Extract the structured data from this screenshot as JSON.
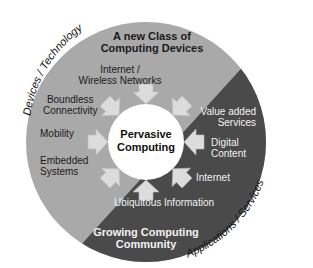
{
  "diagram": {
    "center": {
      "label_line1": "Pervasive",
      "label_line2": "Computing"
    },
    "outer_labels": {
      "top_left": "Devices / Technology",
      "bottom_right": "Applications / Services"
    },
    "segments": {
      "devices": {
        "title_line1": "A new Class of",
        "title_line2": "Computing Devices",
        "color": "#a9a9a9",
        "items": [
          {
            "line1": "Internet /",
            "line2": "Wireless Networks"
          },
          {
            "line1": "Boundless",
            "line2": "Connectivity"
          },
          {
            "line1": "Mobility",
            "line2": ""
          },
          {
            "line1": "Embedded",
            "line2": "Systems"
          }
        ]
      },
      "applications": {
        "title_line1": "Growing Computing",
        "title_line2": "Community",
        "color": "#4a4a4a",
        "items": [
          {
            "line1": "Value added",
            "line2": "Services"
          },
          {
            "line1": "Digital",
            "line2": "Content"
          },
          {
            "line1": "Internet",
            "line2": ""
          },
          {
            "line1": "Ubiquitous Information",
            "line2": ""
          }
        ]
      }
    },
    "arrow_color": "#dcdcdc"
  }
}
